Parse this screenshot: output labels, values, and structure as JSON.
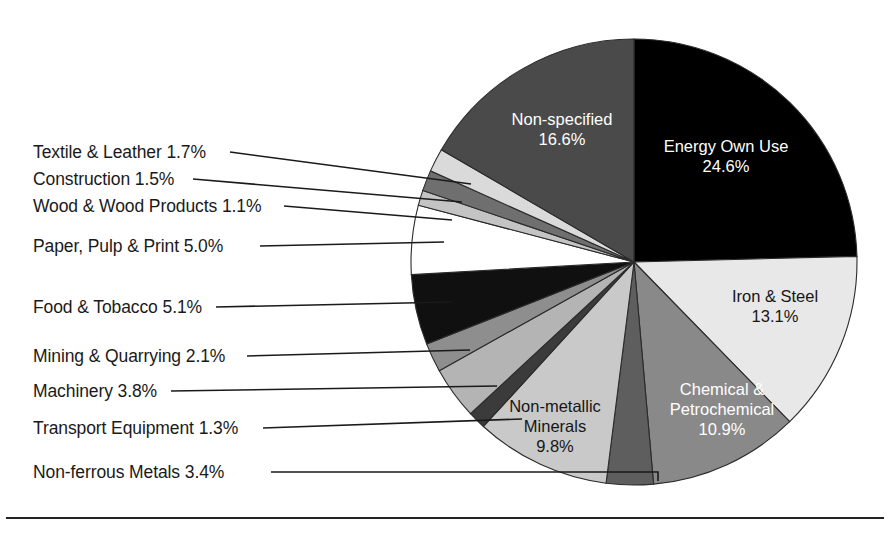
{
  "chart_data": {
    "type": "pie",
    "title": "",
    "subtitle": "",
    "xlabel": "",
    "ylabel": "",
    "legend_position": "none",
    "value_unit": "%",
    "total": 100.0,
    "center": {
      "x": 634,
      "y": 262
    },
    "radius": 223,
    "start_angle_deg": 0,
    "direction": "clockwise",
    "categories": [
      "Energy Own Use",
      "Iron & Steel",
      "Chemical & Petrochemical",
      "Non-ferrous Metals",
      "Non-metallic Minerals",
      "Transport Equipment",
      "Machinery",
      "Mining & Quarrying",
      "Food & Tobacco",
      "Paper, Pulp & Print",
      "Wood & Wood Products",
      "Construction",
      "Textile & Leather",
      "Non-specified"
    ],
    "values": [
      24.6,
      13.1,
      10.9,
      3.4,
      9.8,
      1.3,
      3.8,
      2.1,
      5.1,
      5.0,
      1.1,
      1.5,
      1.7,
      16.6
    ],
    "colors": [
      "#000000",
      "#e8e8e8",
      "#898989",
      "#5e5e5e",
      "#c9c9c9",
      "#3b3b3b",
      "#b4b4b4",
      "#8e8e8e",
      "#101010",
      "#ffffff",
      "#c4c4c4",
      "#6f6f6f",
      "#dadada",
      "#4a4a4a"
    ],
    "slices": [
      {
        "name": "Energy Own Use",
        "value": 24.6,
        "label": "Energy Own Use",
        "value_label": "24.6%",
        "color": "#000000",
        "label_placement": "inside",
        "label_color": "on-dark",
        "label_x": 726,
        "label_y": 152
      },
      {
        "name": "Iron & Steel",
        "value": 13.1,
        "label": "Iron & Steel",
        "value_label": "13.1%",
        "color": "#e8e8e8",
        "label_placement": "inside",
        "label_color": "on-light",
        "label_x": 775,
        "label_y": 302
      },
      {
        "name": "Chemical & Petrochemical",
        "value": 10.9,
        "label": "Chemical &|Petrochemical",
        "value_label": "10.9%",
        "color": "#898989",
        "label_placement": "inside",
        "label_color": "on-dark",
        "label_x": 722,
        "label_y": 395
      },
      {
        "name": "Non-ferrous Metals",
        "value": 3.4,
        "label": "Non-ferrous Metals",
        "value_label": "3.4%",
        "color": "#5e5e5e",
        "label_placement": "leader",
        "label_color": "on-light",
        "label_x": 33,
        "label_y": 478,
        "leader": [
          [
            271,
            472
          ],
          [
            658,
            472
          ],
          [
            658,
            481
          ]
        ]
      },
      {
        "name": "Non-metallic Minerals",
        "value": 9.8,
        "label": "Non-metallic|Minerals",
        "value_label": "9.8%",
        "color": "#c9c9c9",
        "label_placement": "inside",
        "label_color": "on-light",
        "label_x": 555,
        "label_y": 412
      },
      {
        "name": "Transport Equipment",
        "value": 1.3,
        "label": "Transport Equipment",
        "value_label": "1.3%",
        "color": "#3b3b3b",
        "label_placement": "leader",
        "label_color": "on-light",
        "label_x": 33,
        "label_y": 434,
        "leader": [
          [
            263,
            428
          ],
          [
            522,
            419
          ]
        ]
      },
      {
        "name": "Machinery",
        "value": 3.8,
        "label": "Machinery",
        "value_label": "3.8%",
        "color": "#b4b4b4",
        "label_placement": "leader",
        "label_color": "on-light",
        "label_x": 33,
        "label_y": 397,
        "leader": [
          [
            171,
            391
          ],
          [
            497,
            386
          ]
        ]
      },
      {
        "name": "Mining & Quarrying",
        "value": 2.1,
        "label": "Mining & Quarrying",
        "value_label": "2.1%",
        "color": "#8e8e8e",
        "label_placement": "leader",
        "label_color": "on-light",
        "label_x": 33,
        "label_y": 362,
        "leader": [
          [
            247,
            356
          ],
          [
            470,
            350
          ]
        ]
      },
      {
        "name": "Food & Tobacco",
        "value": 5.1,
        "label": "Food & Tobacco",
        "value_label": "5.1%",
        "color": "#101010",
        "label_placement": "leader",
        "label_color": "on-light",
        "label_x": 33,
        "label_y": 313,
        "leader": [
          [
            216,
            307
          ],
          [
            452,
            302
          ]
        ]
      },
      {
        "name": "Paper, Pulp & Print",
        "value": 5.0,
        "label": "Paper, Pulp & Print",
        "value_label": "5.0%",
        "color": "#ffffff",
        "label_placement": "leader",
        "label_color": "on-light",
        "label_x": 33,
        "label_y": 252,
        "leader": [
          [
            260,
            246
          ],
          [
            444,
            242
          ]
        ]
      },
      {
        "name": "Wood & Wood Products",
        "value": 1.1,
        "label": "Wood & Wood Products",
        "value_label": "1.1%",
        "color": "#c4c4c4",
        "label_placement": "leader",
        "label_color": "on-light",
        "label_x": 33,
        "label_y": 212,
        "leader": [
          [
            284,
            206
          ],
          [
            452,
            220
          ]
        ]
      },
      {
        "name": "Construction",
        "value": 1.5,
        "label": "Construction",
        "value_label": "1.5%",
        "color": "#6f6f6f",
        "label_placement": "leader",
        "label_color": "on-light",
        "label_x": 33,
        "label_y": 185,
        "leader": [
          [
            193,
            179
          ],
          [
            462,
            202
          ]
        ]
      },
      {
        "name": "Textile & Leather",
        "value": 1.7,
        "label": "Textile & Leather",
        "value_label": "1.7%",
        "color": "#dadada",
        "label_placement": "leader",
        "label_color": "on-light",
        "label_x": 33,
        "label_y": 158,
        "leader": [
          [
            230,
            152
          ],
          [
            471,
            184
          ]
        ]
      },
      {
        "name": "Non-specified",
        "value": 16.6,
        "label": "Non-specified",
        "value_label": "16.6%",
        "color": "#4a4a4a",
        "label_placement": "inside",
        "label_color": "on-dark",
        "label_x": 562,
        "label_y": 125
      }
    ],
    "leader_labels": [
      {
        "key": "textile",
        "text": "Textile & Leather 1.7%"
      },
      {
        "key": "construction",
        "text": "Construction 1.5%"
      },
      {
        "key": "wood",
        "text": "Wood & Wood Products 1.1%"
      },
      {
        "key": "paper",
        "text": "Paper, Pulp & Print 5.0%"
      },
      {
        "key": "food",
        "text": "Food & Tobacco 5.1%"
      },
      {
        "key": "mining",
        "text": "Mining & Quarrying 2.1%"
      },
      {
        "key": "machinery",
        "text": "Machinery 3.8%"
      },
      {
        "key": "transport",
        "text": "Transport Equipment 1.3%"
      },
      {
        "key": "nonferrous",
        "text": "Non-ferrous Metals 3.4%"
      }
    ],
    "footer_rule": {
      "y": 518,
      "x1": 6,
      "x2": 884
    }
  }
}
